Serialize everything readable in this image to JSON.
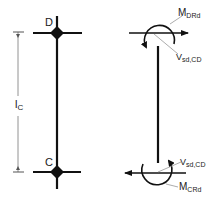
{
  "diagram": {
    "colors": {
      "stroke": "#111111",
      "thin": "#555555",
      "leader": "#888888",
      "background": "#ffffff"
    },
    "left_panel": {
      "node_top": {
        "label": "D"
      },
      "node_bottom": {
        "label": "C"
      },
      "dimension": {
        "label_main": "l",
        "label_sub": "C"
      }
    },
    "right_panel": {
      "top": {
        "moment": {
          "label_main": "M",
          "label_sub": "DRd"
        },
        "shear": {
          "label_main": "V",
          "label_sub": "sd,CD"
        }
      },
      "bottom": {
        "shear": {
          "label_main": "V",
          "label_sub": "sd,CD"
        },
        "moment": {
          "label_main": "M",
          "label_sub": "CRd"
        }
      }
    }
  }
}
